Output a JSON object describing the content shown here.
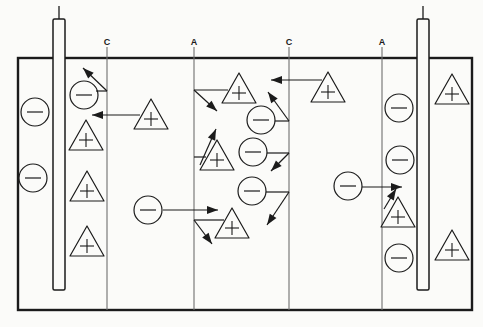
{
  "diagram": {
    "type": "electrodialysis-cell-ion-migration",
    "background": "#fbfbf9",
    "ink": "#1b1b1b",
    "membrane_color": "#6f6f6f",
    "canvas": {
      "w": 483,
      "h": 327
    },
    "container": {
      "x": 18,
      "y": 58,
      "w": 454,
      "h": 252
    },
    "electrodes": [
      {
        "name": "left-electrode",
        "x": 53,
        "y": 19,
        "w": 12,
        "h": 271,
        "lead": {
          "x": 59,
          "y1": 6,
          "y2": 19
        }
      },
      {
        "name": "right-electrode",
        "x": 417,
        "y": 19,
        "w": 12,
        "h": 271,
        "lead": {
          "x": 423,
          "y1": 6,
          "y2": 19
        }
      }
    ],
    "membranes": [
      {
        "label": "C",
        "x": 107,
        "label_y": 45,
        "y1": 47,
        "y2": 310
      },
      {
        "label": "A",
        "x": 194,
        "label_y": 45,
        "y1": 47,
        "y2": 310
      },
      {
        "label": "C",
        "x": 289,
        "label_y": 45,
        "y1": 47,
        "y2": 310
      },
      {
        "label": "A",
        "x": 382,
        "label_y": 45,
        "y1": 47,
        "y2": 310
      }
    ],
    "ions": {
      "anion": {
        "shape": "circle",
        "symbol": "−",
        "r": 14
      },
      "cation": {
        "shape": "triangle",
        "symbol": "+"
      },
      "items": [
        {
          "kind": "anion",
          "x": 35,
          "y": 112
        },
        {
          "kind": "anion",
          "x": 33,
          "y": 178
        },
        {
          "kind": "anion",
          "x": 84,
          "y": 95
        },
        {
          "kind": "cation",
          "x": 86,
          "y": 136
        },
        {
          "kind": "cation",
          "x": 87,
          "y": 187
        },
        {
          "kind": "cation",
          "x": 87,
          "y": 242
        },
        {
          "kind": "cation",
          "x": 151,
          "y": 115
        },
        {
          "kind": "anion",
          "x": 148,
          "y": 210
        },
        {
          "kind": "cation",
          "x": 239,
          "y": 89
        },
        {
          "kind": "anion",
          "x": 261,
          "y": 120
        },
        {
          "kind": "cation",
          "x": 217,
          "y": 156
        },
        {
          "kind": "anion",
          "x": 253,
          "y": 152
        },
        {
          "kind": "anion",
          "x": 252,
          "y": 191
        },
        {
          "kind": "cation",
          "x": 232,
          "y": 224
        },
        {
          "kind": "cation",
          "x": 328,
          "y": 88
        },
        {
          "kind": "anion",
          "x": 348,
          "y": 186
        },
        {
          "kind": "anion",
          "x": 399,
          "y": 108
        },
        {
          "kind": "anion",
          "x": 400,
          "y": 160
        },
        {
          "kind": "cation",
          "x": 398,
          "y": 213
        },
        {
          "kind": "anion",
          "x": 399,
          "y": 258
        },
        {
          "kind": "cation",
          "x": 452,
          "y": 90
        },
        {
          "kind": "cation",
          "x": 452,
          "y": 246
        }
      ]
    },
    "arrows": [
      {
        "pts": [
          [
            96,
            91
          ],
          [
            107,
            91
          ]
        ],
        "head": false
      },
      {
        "pts": [
          [
            107,
            91
          ],
          [
            83,
            68
          ]
        ],
        "head": true
      },
      {
        "pts": [
          [
            140,
            115
          ],
          [
            92,
            115
          ]
        ],
        "head": true
      },
      {
        "pts": [
          [
            163,
            210
          ],
          [
            218,
            210
          ]
        ],
        "head": true
      },
      {
        "pts": [
          [
            228,
            90
          ],
          [
            194,
            90
          ]
        ],
        "head": false
      },
      {
        "pts": [
          [
            194,
            90
          ],
          [
            217,
            111
          ]
        ],
        "head": true
      },
      {
        "pts": [
          [
            275,
            121
          ],
          [
            289,
            121
          ]
        ],
        "head": false
      },
      {
        "pts": [
          [
            289,
            121
          ],
          [
            268,
            92
          ]
        ],
        "head": true
      },
      {
        "pts": [
          [
            206,
            157
          ],
          [
            194,
            157
          ]
        ],
        "head": false
      },
      {
        "pts": [
          [
            200,
            165
          ],
          [
            216,
            129
          ]
        ],
        "head": true
      },
      {
        "pts": [
          [
            267,
            153
          ],
          [
            289,
            153
          ]
        ],
        "head": false
      },
      {
        "pts": [
          [
            289,
            153
          ],
          [
            271,
            171
          ]
        ],
        "head": true
      },
      {
        "pts": [
          [
            266,
            192
          ],
          [
            289,
            192
          ]
        ],
        "head": false
      },
      {
        "pts": [
          [
            289,
            192
          ],
          [
            267,
            225
          ]
        ],
        "head": true
      },
      {
        "pts": [
          [
            224,
            220
          ],
          [
            194,
            220
          ]
        ],
        "head": false
      },
      {
        "pts": [
          [
            194,
            220
          ],
          [
            212,
            244
          ]
        ],
        "head": true
      },
      {
        "pts": [
          [
            322,
            80
          ],
          [
            271,
            80
          ]
        ],
        "head": true
      },
      {
        "pts": [
          [
            362,
            187
          ],
          [
            402,
            187
          ]
        ],
        "head": true
      },
      {
        "pts": [
          [
            384,
            209
          ],
          [
            396,
            189
          ]
        ],
        "head": true
      }
    ]
  }
}
